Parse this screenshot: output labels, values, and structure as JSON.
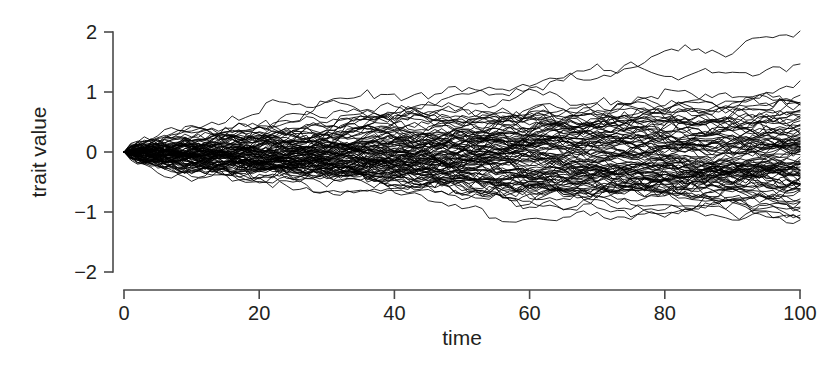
{
  "chart_data": {
    "type": "line",
    "title": "",
    "subtitle": "",
    "xlabel": "time",
    "ylabel": "trait value",
    "xlim": [
      0,
      100
    ],
    "ylim": [
      -2,
      2
    ],
    "xticks": [
      0,
      20,
      40,
      60,
      80,
      100
    ],
    "xtick_labels": [
      "0",
      "20",
      "40",
      "60",
      "80",
      "100"
    ],
    "yticks": [
      -2,
      -1,
      0,
      1,
      2
    ],
    "ytick_labels": [
      "−2",
      "−1",
      "0",
      "1",
      "2"
    ],
    "grid": false,
    "legend": null,
    "legend_position": "none",
    "line_color": "#000000",
    "line_width": 0.85,
    "background_color": "#ffffff",
    "axis_color": "#4a4a4a",
    "text_color": "#231f20",
    "n_series": 100,
    "n_steps": 100,
    "start_value": 0,
    "diffusion_rate": 0.0032,
    "envelope": {
      "description": "Approximate spread of the bundle of trajectories, read off the plot at selected times.",
      "x": [
        0,
        10,
        20,
        30,
        40,
        50,
        60,
        70,
        80,
        90,
        100
      ],
      "upper": [
        0.0,
        0.2,
        0.3,
        0.36,
        0.42,
        0.47,
        0.5,
        0.53,
        0.56,
        0.58,
        0.62
      ],
      "lower": [
        0.0,
        -0.19,
        -0.29,
        -0.35,
        -0.41,
        -0.45,
        -0.49,
        -0.52,
        -0.55,
        -0.58,
        -0.62
      ],
      "extreme_upper_at_100": 0.72,
      "extreme_lower_at_100": -0.8
    }
  }
}
